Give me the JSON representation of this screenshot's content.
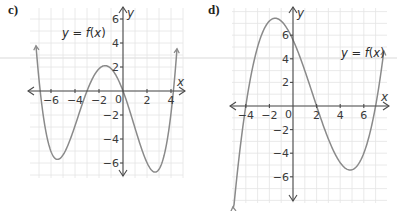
{
  "chart_data": [
    {
      "id": "c",
      "type": "line",
      "part_label": "c)",
      "function_label": "y = f(x)",
      "xlabel": "x",
      "ylabel": "y",
      "origin_label": "0",
      "x_ticks": [
        -6,
        -4,
        -2,
        2,
        4
      ],
      "x_tick_labels": [
        "−6",
        "−4",
        "−2",
        "2",
        "4"
      ],
      "y_ticks": [
        6,
        4,
        2,
        -2,
        -4,
        -6
      ],
      "y_tick_labels": [
        "6",
        "4",
        "2",
        "−2",
        "−4",
        "−6"
      ],
      "xlim": [
        -7.7,
        5.0
      ],
      "ylim": [
        -7.0,
        7.0
      ],
      "grid": true,
      "curve": {
        "kind": "quartic",
        "roots": [
          -6.9,
          -3,
          0,
          4.2
        ],
        "leading_coefficient": 0.0305,
        "x_range": [
          -7.25,
          4.5
        ],
        "key_points": {
          "local_max": [
            -1.3,
            2.2
          ],
          "local_min_left": [
            -5.3,
            -6.4
          ],
          "local_min_right": [
            2.5,
            -6.4
          ],
          "y_intercept": 0
        }
      },
      "layout": {
        "origin_px": [
          123,
          91
        ],
        "unit_px": 12,
        "grid_px": [
          30,
          8,
          183,
          178
        ],
        "label_px": [
          8,
          14
        ],
        "func_label_px": [
          62,
          37
        ]
      }
    },
    {
      "id": "d",
      "type": "line",
      "part_label": "d)",
      "function_label": "y = f(x)",
      "xlabel": "x",
      "ylabel": "y",
      "origin_label": "0",
      "x_ticks": [
        -4,
        -2,
        2,
        4,
        6
      ],
      "x_tick_labels": [
        "−4",
        "−2",
        "2",
        "4",
        "6"
      ],
      "y_ticks": [
        6,
        4,
        2,
        -2,
        -4,
        -6
      ],
      "y_tick_labels": [
        "6",
        "4",
        "2",
        "−2",
        "−4",
        "−6"
      ],
      "xlim": [
        -5.2,
        8.0
      ],
      "ylim": [
        -8.0,
        8.0
      ],
      "grid": true,
      "curve": {
        "kind": "cubic",
        "roots": [
          -4,
          2,
          7
        ],
        "leading_coefficient": 0.1,
        "x_range": [
          -5.1,
          7.7
        ],
        "key_points": {
          "local_max": [
            -1.3,
            7.3
          ],
          "local_min": [
            4.7,
            -5.5
          ],
          "y_intercept": 5.6
        }
      },
      "layout": {
        "origin_px": [
          293,
          106
        ],
        "unit_px": 11.8,
        "grid_px": [
          232,
          8,
          387,
          203
        ],
        "label_px": [
          208,
          14
        ],
        "func_label_px": [
          341,
          57
        ]
      }
    }
  ]
}
